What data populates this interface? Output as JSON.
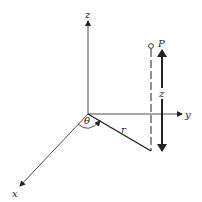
{
  "diagram": {
    "axes": {
      "x_label": "x",
      "y_label": "y",
      "z_label": "z"
    },
    "labels": {
      "point": "P",
      "radius": "r",
      "angle": "θ",
      "height": "z"
    },
    "colors": {
      "line": "#222222",
      "background": "#ffffff"
    }
  }
}
